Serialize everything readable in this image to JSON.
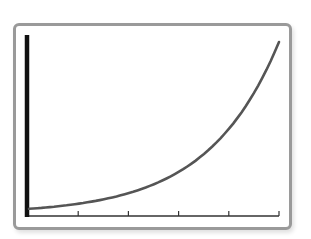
{
  "chart_data": {
    "type": "line",
    "title": "",
    "xlabel": "",
    "ylabel": "",
    "x_tick_count": 5,
    "x_tick_labels": [],
    "y_tick_labels": [],
    "grid": false,
    "legend": null,
    "series": [
      {
        "name": "exponential curve",
        "shape": "exponential growth",
        "x": [
          0,
          0.5,
          1,
          1.5,
          2,
          2.5,
          3,
          3.5,
          4,
          4.5,
          5
        ],
        "y": [
          0.03,
          0.04,
          0.06,
          0.09,
          0.13,
          0.18,
          0.25,
          0.35,
          0.49,
          0.7,
          1.0
        ]
      }
    ],
    "xlim": [
      0,
      5
    ],
    "ylim": [
      0,
      1.05
    ]
  },
  "colors": {
    "frame": "#9a9a9a",
    "y_axis": "#111111",
    "x_axis": "#333333",
    "curve": "#555555"
  }
}
